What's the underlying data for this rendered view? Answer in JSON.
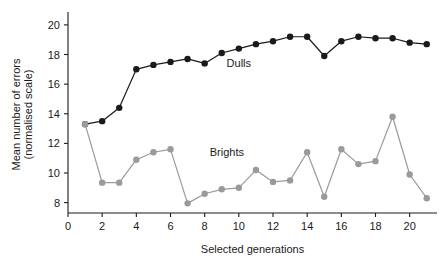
{
  "chart_data": {
    "type": "line",
    "title": "",
    "xlabel": "Selected generations",
    "ylabel": "Mean number of errors\n(normalised scale)",
    "ylabel_line1": "Mean number of errors",
    "ylabel_line2": "(normalised scale)",
    "x": [
      1,
      2,
      3,
      4,
      5,
      6,
      7,
      8,
      9,
      10,
      11,
      12,
      13,
      14,
      15,
      16,
      17,
      18,
      19,
      20,
      21
    ],
    "xlim": [
      0,
      21.6
    ],
    "ylim": [
      7.3,
      20.6
    ],
    "xticks": [
      0,
      2,
      4,
      6,
      8,
      10,
      12,
      14,
      16,
      18,
      20
    ],
    "xtick_labels": [
      "0",
      "2",
      "4",
      "6",
      "8",
      "10",
      "12",
      "14",
      "16",
      "18",
      "20"
    ],
    "yticks": [
      8,
      10,
      12,
      14,
      16,
      18,
      20
    ],
    "ytick_labels": [
      "8",
      "10",
      "12",
      "14",
      "16",
      "18",
      "20"
    ],
    "grid": false,
    "legend_position": "inline-annotation",
    "series": [
      {
        "name": "Dulls",
        "color": "#1a1a1a",
        "marker": "circle",
        "label_x": 10.0,
        "label_y": 17.15,
        "values": [
          13.3,
          13.5,
          14.4,
          17.0,
          17.3,
          17.5,
          17.7,
          17.4,
          18.1,
          18.4,
          18.7,
          18.9,
          19.2,
          19.2,
          17.9,
          18.9,
          19.2,
          19.1,
          19.1,
          18.8,
          18.7
        ]
      },
      {
        "name": "Brights",
        "color": "#9a9a9a",
        "marker": "circle",
        "label_x": 9.3,
        "label_y": 11.15,
        "values": [
          13.3,
          9.35,
          9.35,
          10.9,
          11.4,
          11.6,
          7.95,
          8.6,
          8.9,
          9.0,
          10.2,
          9.4,
          9.5,
          11.4,
          8.4,
          11.6,
          10.6,
          10.8,
          13.8,
          9.9,
          8.3
        ]
      }
    ]
  },
  "labels": {
    "dulls": "Dulls",
    "brights": "Brights",
    "xaxis": "Selected generations",
    "yaxis_line1": "Mean number of errors",
    "yaxis_line2": "(normalised scale)"
  }
}
